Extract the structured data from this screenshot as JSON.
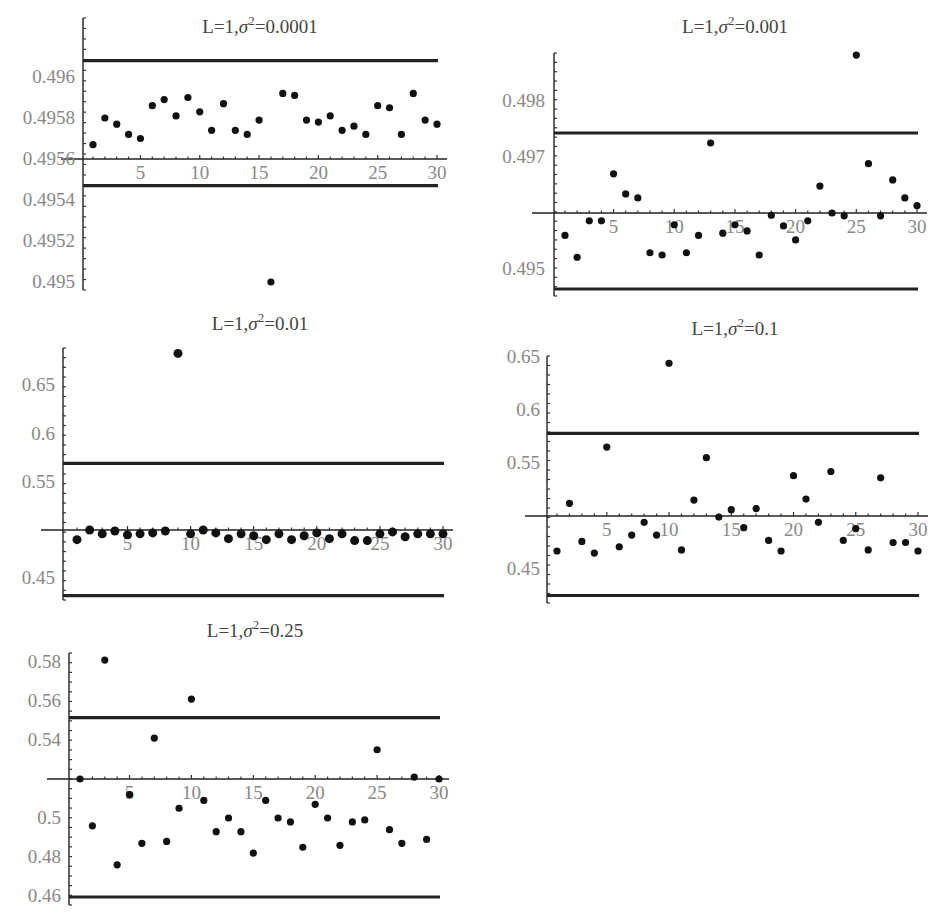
{
  "chart_data": [
    {
      "type": "scatter",
      "title": "L=1,σ²=0.0001",
      "title_parts": {
        "prefix": "L=1,",
        "sigma": "σ",
        "exp": "2",
        "suffix": "=0.0001"
      },
      "xlabel": "",
      "ylabel": "",
      "x": [
        1,
        2,
        3,
        4,
        5,
        6,
        7,
        8,
        9,
        10,
        11,
        12,
        13,
        14,
        15,
        16,
        17,
        18,
        19,
        20,
        21,
        22,
        23,
        24,
        25,
        26,
        27,
        28,
        29,
        30
      ],
      "values": [
        0.49567,
        0.4958,
        0.49577,
        0.49572,
        0.4957,
        0.49586,
        0.49589,
        0.49581,
        0.4959,
        0.49583,
        0.49574,
        0.49587,
        0.49574,
        0.49572,
        0.49579,
        0.495,
        0.49592,
        0.49591,
        0.49579,
        0.49578,
        0.49581,
        0.49574,
        0.49576,
        0.49572,
        0.49586,
        0.49585,
        0.49572,
        0.49592,
        0.49579,
        0.49577
      ],
      "ucl": 0.49608,
      "lcl": 0.49547,
      "x_axis_at": 0.4956,
      "ylim": [
        0.49496,
        0.49626
      ],
      "xlim": [
        0,
        31
      ],
      "yticks": [
        "0.495",
        "0.4952",
        "0.4954",
        "0.4956",
        "0.4958",
        "0.496"
      ],
      "xticks": [
        "5",
        "10",
        "15",
        "20",
        "25",
        "30"
      ],
      "layout": {
        "y0px": 159,
        "yval0": 0.4956,
        "pxPerUnit": 205000,
        "axisX": 83,
        "x1px": 93,
        "x30px": 437,
        "topPx": 18,
        "botPx": 290,
        "lineEnd": 438,
        "titleX": 260,
        "titleY": 33,
        "labelRight": 75
      }
    },
    {
      "type": "scatter",
      "title": "L=1,σ²=0.001",
      "title_parts": {
        "prefix": "L=1,",
        "sigma": "σ",
        "exp": "2",
        "suffix": "=0.001"
      },
      "xlabel": "",
      "ylabel": "",
      "x": [
        1,
        2,
        3,
        4,
        5,
        6,
        7,
        8,
        9,
        10,
        11,
        12,
        13,
        14,
        15,
        16,
        17,
        18,
        19,
        20,
        21,
        22,
        23,
        24,
        25,
        26,
        27,
        28,
        29,
        30
      ],
      "values": [
        0.4956,
        0.49521,
        0.49586,
        0.49586,
        0.4967,
        0.49634,
        0.49627,
        0.49529,
        0.49525,
        0.49579,
        0.49529,
        0.4956,
        0.49725,
        0.49564,
        0.49579,
        0.49568,
        0.49525,
        0.49596,
        0.49577,
        0.49552,
        0.49586,
        0.49648,
        0.496,
        0.49595,
        0.49882,
        0.49688,
        0.49595,
        0.49659,
        0.49627,
        0.49613
      ],
      "ucl": 0.49764,
      "lcl": 0.49861,
      "ucl_value": 0.49764,
      "lcl_value": 0.49864,
      "x_axis_at": 0.496,
      "ylim": [
        0.49465,
        0.49889
      ],
      "xlim": [
        0,
        31
      ],
      "yticks": [
        "0.495",
        "0.497",
        "0.498"
      ],
      "xticks": [
        "5",
        "10",
        "15",
        "20",
        "25",
        "30"
      ],
      "layout": {
        "y0px": 213,
        "yval0": 0.496,
        "pxPerUnit": 56000,
        "axisX": 554,
        "x1px": 565,
        "x30px": 917,
        "topPx": 53,
        "botPx": 296,
        "lineEnd": 918,
        "titleX": 735,
        "titleY": 33,
        "labelRight": 545,
        "uclPx": 133,
        "lclPx": 289
      }
    },
    {
      "type": "scatter",
      "title": "L=1,σ²=0.01",
      "title_parts": {
        "prefix": "L=1,",
        "sigma": "σ",
        "exp": "2",
        "suffix": "=0.01"
      },
      "xlabel": "",
      "ylabel": "",
      "x": [
        1,
        2,
        3,
        4,
        5,
        6,
        7,
        8,
        9,
        10,
        11,
        12,
        13,
        14,
        15,
        16,
        17,
        18,
        19,
        20,
        21,
        22,
        23,
        24,
        25,
        26,
        27,
        28,
        29,
        30
      ],
      "values": [
        0.49,
        0.5,
        0.496,
        0.499,
        0.495,
        0.496,
        0.497,
        0.499,
        0.683,
        0.496,
        0.5,
        0.497,
        0.491,
        0.496,
        0.494,
        0.49,
        0.496,
        0.49,
        0.494,
        0.497,
        0.491,
        0.496,
        0.489,
        0.489,
        0.496,
        0.498,
        0.493,
        0.496,
        0.496,
        0.496
      ],
      "ucl": 0.569,
      "lcl": 0.432,
      "x_axis_at": 0.5,
      "ylim": [
        0.428,
        0.697
      ],
      "xlim": [
        0,
        31
      ],
      "yticks": [
        "0.45",
        "0.55",
        "0.6",
        "0.65"
      ],
      "xticks": [
        "5",
        "10",
        "15",
        "20",
        "25",
        "30"
      ],
      "layout": {
        "y0px": 530,
        "yval0": 0.5,
        "pxPerUnit": 965,
        "axisX": 63,
        "x1px": 77,
        "x30px": 443,
        "topPx": 348,
        "botPx": 600,
        "lineEnd": 444,
        "titleX": 260,
        "titleY": 330,
        "labelRight": 55
      }
    },
    {
      "type": "scatter",
      "title": "L=1,σ²=0.1",
      "title_parts": {
        "prefix": "L=1,",
        "sigma": "σ",
        "exp": "2",
        "suffix": "=0.1"
      },
      "xlabel": "",
      "ylabel": "",
      "x": [
        1,
        2,
        3,
        4,
        5,
        6,
        7,
        8,
        9,
        10,
        11,
        12,
        13,
        14,
        15,
        16,
        17,
        18,
        19,
        20,
        21,
        22,
        23,
        24,
        25,
        26,
        27,
        28,
        29,
        30
      ],
      "values": [
        0.467,
        0.512,
        0.476,
        0.465,
        0.565,
        0.471,
        0.482,
        0.494,
        0.482,
        0.644,
        0.468,
        0.515,
        0.555,
        0.499,
        0.506,
        0.489,
        0.507,
        0.477,
        0.467,
        0.538,
        0.516,
        0.494,
        0.542,
        0.477,
        0.488,
        0.468,
        0.536,
        0.475,
        0.475,
        0.467
      ],
      "ucl": 0.578,
      "lcl": 0.425,
      "x_axis_at": 0.5,
      "ylim": [
        0.42,
        0.65
      ],
      "xlim": [
        0,
        31
      ],
      "yticks": [
        "0.45",
        "0.55",
        "0.6",
        "0.65"
      ],
      "xticks": [
        "5",
        "10",
        "15",
        "20",
        "25",
        "30"
      ],
      "layout": {
        "y0px": 516,
        "yval0": 0.5,
        "pxPerUnit": 1060,
        "axisX": 547,
        "x1px": 557,
        "x30px": 918,
        "topPx": 356,
        "botPx": 603,
        "lineEnd": 919,
        "titleX": 735,
        "titleY": 335,
        "labelRight": 540
      }
    },
    {
      "type": "scatter",
      "title": "L=1,σ²=0.25",
      "title_parts": {
        "prefix": "L=1,",
        "sigma": "σ",
        "exp": "2",
        "suffix": "=0.25"
      },
      "xlabel": "",
      "ylabel": "",
      "x": [
        1,
        2,
        3,
        4,
        5,
        6,
        7,
        8,
        9,
        10,
        11,
        12,
        13,
        14,
        15,
        16,
        17,
        18,
        19,
        20,
        21,
        22,
        23,
        24,
        25,
        26,
        27,
        28,
        29,
        30
      ],
      "values": [
        0.52,
        0.496,
        0.581,
        0.476,
        0.512,
        0.487,
        0.541,
        0.488,
        0.505,
        0.561,
        0.509,
        0.493,
        0.5,
        0.493,
        0.482,
        0.509,
        0.5,
        0.498,
        0.485,
        0.507,
        0.5,
        0.486,
        0.498,
        0.499,
        0.535,
        0.494,
        0.487,
        0.521,
        0.489,
        0.52
      ],
      "ucl": 0.5515,
      "lcl": 0.4595,
      "x_axis_at": 0.52,
      "ylim": [
        0.457,
        0.585
      ],
      "xlim": [
        0,
        31
      ],
      "yticks": [
        "0.46",
        "0.48",
        "0.5",
        "0.54",
        "0.56",
        "0.58"
      ],
      "xticks": [
        "5",
        "10",
        "15",
        "20",
        "25",
        "30"
      ],
      "layout": {
        "y0px": 779,
        "yval0": 0.52,
        "pxPerUnit": 1950,
        "axisX": 69,
        "x1px": 80,
        "x30px": 439,
        "topPx": 653,
        "botPx": 905,
        "lineEnd": 440,
        "titleX": 255,
        "titleY": 637,
        "labelRight": 61
      }
    }
  ]
}
